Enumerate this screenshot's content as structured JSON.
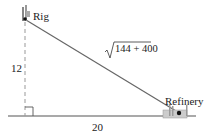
{
  "diagram": {
    "type": "right-triangle-word-problem",
    "points": {
      "rig": {
        "label": "Rig"
      },
      "refinery": {
        "label": "Refinery"
      }
    },
    "labels": {
      "vertical_side": "12",
      "horizontal_side": "20",
      "hypotenuse_radicand": "144 + 400",
      "hypotenuse_symbol": "√"
    },
    "colors": {
      "line": "#333333",
      "dashed": "#888888",
      "ground": "#555555"
    }
  }
}
